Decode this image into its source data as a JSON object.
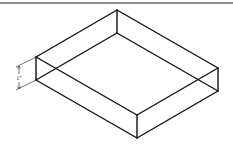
{
  "diagram": {
    "type": "isometric-drawing",
    "colors": {
      "line": "#111111",
      "background": "#ffffff"
    },
    "top_rule": {
      "x1": 0,
      "y1": 3,
      "x2": 233,
      "y2": 3
    },
    "vertices": {
      "top_back": [
        117,
        10
      ],
      "top_left": [
        36,
        57
      ],
      "top_right": [
        218,
        68
      ],
      "top_front": [
        137,
        115
      ],
      "bottom_back": [
        117,
        33
      ],
      "bottom_left": [
        36,
        80
      ],
      "bottom_right": [
        218,
        91
      ],
      "bottom_front": [
        137,
        138
      ]
    },
    "dimension": {
      "label": "1\"",
      "measures": "height",
      "extension_top": [
        [
          36,
          57
        ],
        [
          16,
          67
        ]
      ],
      "extension_bottom": [
        [
          36,
          80
        ],
        [
          16,
          90
        ]
      ],
      "dimension_line": [
        [
          19,
          66
        ],
        [
          19,
          89
        ]
      ],
      "label_pos": [
        19,
        79
      ]
    }
  }
}
